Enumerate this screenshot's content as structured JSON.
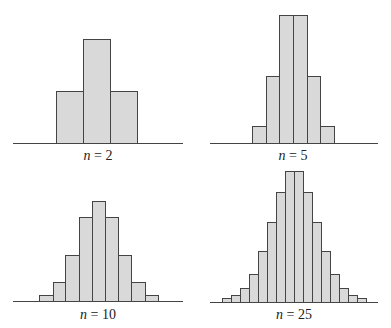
{
  "colors": {
    "bar_fill": "#d9d9d9",
    "bar_stroke": "#444444",
    "axis": "#444444",
    "text": "#222222"
  },
  "chart_data": [
    {
      "type": "bar",
      "title": "n = 2",
      "label_var": "n",
      "label_eq": " = ",
      "label_val": "2",
      "values": [
        1,
        2,
        1
      ],
      "grid": false,
      "panel": {
        "axis_x0": 13,
        "axis_x1": 183,
        "base_y": 143,
        "label_x": 98,
        "label_y": 160
      },
      "edges": [
        56,
        83,
        110,
        137
      ],
      "tops": [
        91,
        39,
        91
      ]
    },
    {
      "type": "bar",
      "title": "n = 5",
      "label_var": "n",
      "label_eq": " = ",
      "label_val": "5",
      "values": [
        1,
        5,
        10,
        10,
        5,
        1
      ],
      "grid": false,
      "panel": {
        "axis_x0": 210,
        "axis_x1": 378,
        "base_y": 143,
        "label_x": 293,
        "label_y": 160
      },
      "edges": [
        252,
        266,
        279,
        293,
        307,
        320,
        334
      ],
      "tops": [
        126,
        76,
        15,
        15,
        76,
        126
      ]
    },
    {
      "type": "bar",
      "title": "n = 10",
      "label_var": "n",
      "label_eq": " = ",
      "label_val": "10",
      "values": [
        0.4,
        1.1,
        3.1,
        5.1,
        5.9,
        5.1,
        3.1,
        1.1,
        0.4
      ],
      "grid": false,
      "panel": {
        "axis_x0": 13,
        "axis_x1": 183,
        "base_y": 301,
        "label_x": 98,
        "label_y": 319
      },
      "edges": [
        39,
        53,
        65,
        79,
        92,
        105,
        118,
        131,
        145,
        158
      ],
      "tops": [
        295,
        282,
        255,
        217,
        201,
        217,
        255,
        282,
        295
      ]
    },
    {
      "type": "bar",
      "title": "n = 25",
      "label_var": "n",
      "label_eq": " = ",
      "label_val": "25",
      "values": [
        0.3,
        0.5,
        1.0,
        2.0,
        3.7,
        5.8,
        8.0,
        9.6,
        9.6,
        8.0,
        5.8,
        3.7,
        2.0,
        1.0,
        0.5,
        0.3
      ],
      "grid": false,
      "panel": {
        "axis_x0": 210,
        "axis_x1": 378,
        "base_y": 302,
        "label_x": 294,
        "label_y": 319
      },
      "edges": [
        222,
        231,
        240,
        249,
        258,
        267,
        276,
        285,
        294,
        303,
        312,
        321,
        330,
        339,
        348,
        357,
        366
      ],
      "tops": [
        298,
        295,
        288,
        274,
        251,
        222,
        192,
        171,
        171,
        192,
        222,
        251,
        274,
        288,
        295,
        298
      ]
    }
  ]
}
